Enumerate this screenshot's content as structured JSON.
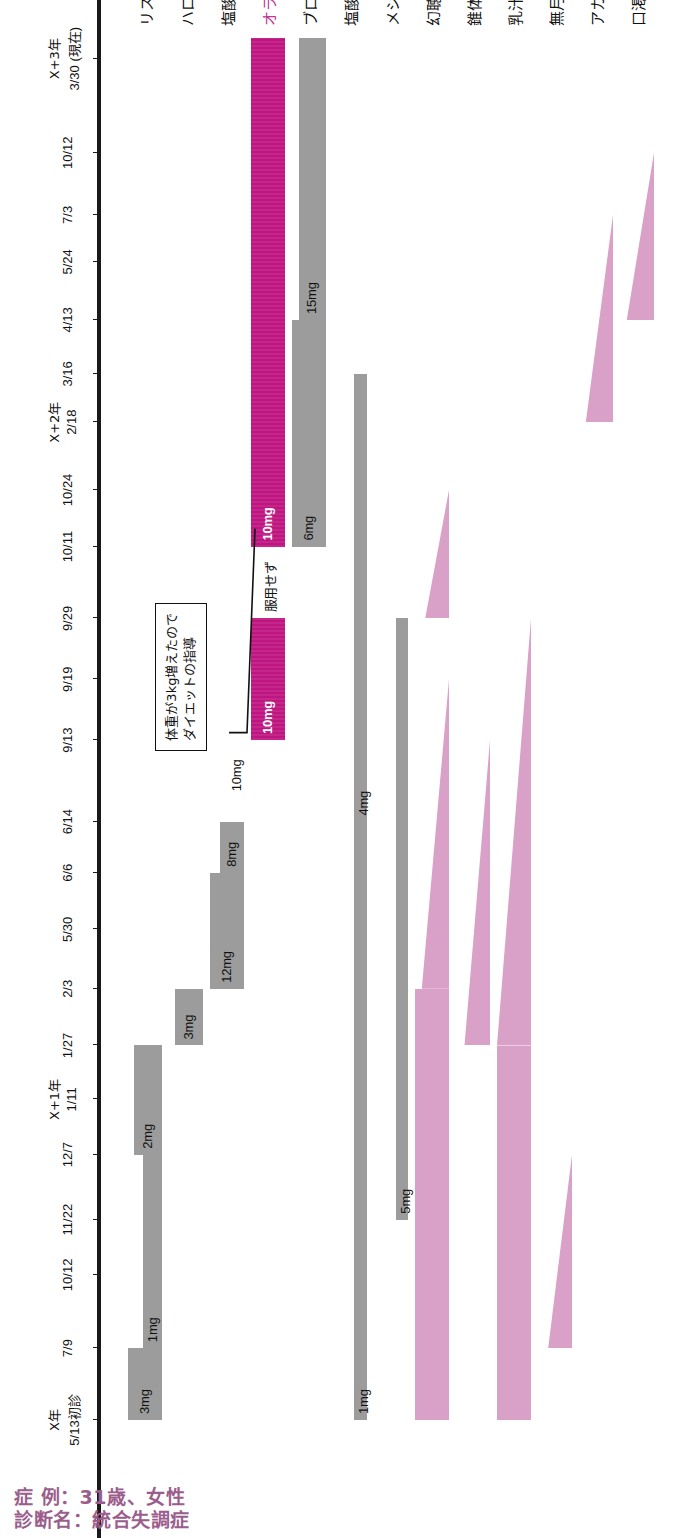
{
  "header": {
    "case_line": "症 例：31歳、女性",
    "diagnosis_line": "診断名：統合失調症",
    "accent_color": "#9B5E8C"
  },
  "chart_data": {
    "type": "table",
    "xlabel": "",
    "ylabel": "",
    "grid": false,
    "legend_position": "none",
    "axis": {
      "name": "治療経過（日付）",
      "ticks": [
        {
          "year": "X年",
          "date": "5/13初診",
          "pos": 0.0
        },
        {
          "year": "",
          "date": "7/9",
          "pos": 0.052
        },
        {
          "year": "",
          "date": "10/12",
          "pos": 0.105
        },
        {
          "year": "",
          "date": "11/22",
          "pos": 0.145
        },
        {
          "year": "",
          "date": "12/7",
          "pos": 0.192
        },
        {
          "year": "X+1年",
          "date": "1/11",
          "pos": 0.232
        },
        {
          "year": "",
          "date": "1/27",
          "pos": 0.271
        },
        {
          "year": "",
          "date": "2/3",
          "pos": 0.312
        },
        {
          "year": "",
          "date": "5/30",
          "pos": 0.355
        },
        {
          "year": "",
          "date": "6/6",
          "pos": 0.396
        },
        {
          "year": "",
          "date": "6/14",
          "pos": 0.433
        },
        {
          "year": "",
          "date": "9/13",
          "pos": 0.492
        },
        {
          "year": "",
          "date": "9/19",
          "pos": 0.536
        },
        {
          "year": "",
          "date": "9/29",
          "pos": 0.58
        },
        {
          "year": "",
          "date": "10/11",
          "pos": 0.632
        },
        {
          "year": "",
          "date": "10/24",
          "pos": 0.673
        },
        {
          "year": "X+2年",
          "date": "2/18",
          "pos": 0.722
        },
        {
          "year": "",
          "date": "3/16",
          "pos": 0.757
        },
        {
          "year": "",
          "date": "4/13",
          "pos": 0.796
        },
        {
          "year": "",
          "date": "5/24",
          "pos": 0.838
        },
        {
          "year": "",
          "date": "7/3",
          "pos": 0.872
        },
        {
          "year": "",
          "date": "10/12",
          "pos": 0.917
        },
        {
          "year": "X+3年",
          "date": "3/30 (現在)",
          "pos": 0.985
        }
      ]
    },
    "rows": [
      {
        "label": "リスペリドン",
        "kind": "drug",
        "accent": false,
        "segments": [
          {
            "dose": "3mg",
            "start": 0.0,
            "end": 0.052,
            "thick": 1.0
          },
          {
            "dose": "1mg",
            "start": 0.052,
            "end": 0.192,
            "thick": 0.55
          },
          {
            "dose": "2mg",
            "start": 0.192,
            "end": 0.271,
            "thick": 0.82
          }
        ]
      },
      {
        "label": "ハロペリドール",
        "kind": "drug",
        "accent": false,
        "segments": [
          {
            "dose": "3mg",
            "start": 0.271,
            "end": 0.312,
            "thick": 0.82
          }
        ]
      },
      {
        "label": "塩酸ペロスピロン",
        "kind": "drug",
        "accent": false,
        "segments": [
          {
            "dose": "12mg",
            "start": 0.312,
            "end": 0.396,
            "thick": 1.0
          },
          {
            "dose": "8mg",
            "start": 0.396,
            "end": 0.433,
            "thick": 0.72
          }
        ]
      },
      {
        "label": "オランザピン",
        "kind": "drug",
        "accent": true,
        "note": "10mg",
        "segments": [
          {
            "dose": "10mg",
            "start": 0.492,
            "end": 0.58,
            "thick": 1.0,
            "color": "magenta"
          },
          {
            "dose": "服用せず",
            "start": 0.58,
            "end": 0.632,
            "thick": 0.0,
            "color": "gap"
          },
          {
            "dose": "10mg",
            "start": 0.632,
            "end": 1.0,
            "thick": 1.0,
            "color": "magenta"
          }
        ]
      },
      {
        "label": "ブロマゼパム",
        "kind": "drug",
        "accent": false,
        "segments": [
          {
            "dose": "6mg",
            "start": 0.632,
            "end": 0.796,
            "thick": 1.0
          },
          {
            "dose": "15mg",
            "start": 0.796,
            "end": 1.0,
            "thick": 0.8
          }
        ]
      },
      {
        "label": "塩酸ビペリデン",
        "kind": "drug",
        "accent": false,
        "segments": [
          {
            "dose": "1mg",
            "start": 0.0,
            "end": 0.433,
            "thick": 0.38
          },
          {
            "dose": "4mg",
            "start": 0.433,
            "end": 0.757,
            "thick": 0.38
          }
        ]
      },
      {
        "label": "メシル酸ブロモクリプチン",
        "kind": "drug",
        "accent": false,
        "segments": [
          {
            "dose": "5mg",
            "start": 0.145,
            "end": 0.58,
            "thick": 0.34
          }
        ]
      },
      {
        "label": "幻聴",
        "kind": "symptom",
        "accent": false,
        "wedges": [
          {
            "start": 0.0,
            "end": 0.312,
            "from": 1.0,
            "to": 1.0
          },
          {
            "start": 0.312,
            "end": 0.536,
            "from": 0.8,
            "to": 0.0
          },
          {
            "start": 0.58,
            "end": 0.673,
            "from": 0.7,
            "to": 0.0
          }
        ]
      },
      {
        "label": "錐体外路症状",
        "kind": "symptom",
        "accent": false,
        "wedges": [
          {
            "start": 0.271,
            "end": 0.492,
            "from": 0.75,
            "to": 0.0
          }
        ]
      },
      {
        "label": "乳汁分泌",
        "kind": "symptom",
        "accent": false,
        "wedges": [
          {
            "start": 0.0,
            "end": 0.271,
            "from": 1.0,
            "to": 1.0
          },
          {
            "start": 0.271,
            "end": 0.58,
            "from": 1.0,
            "to": 0.0
          }
        ]
      },
      {
        "label": "無月経",
        "kind": "symptom",
        "accent": false,
        "wedges": [
          {
            "start": 0.052,
            "end": 0.192,
            "from": 0.7,
            "to": 0.0
          }
        ]
      },
      {
        "label": "アカシジア",
        "kind": "symptom",
        "accent": false,
        "wedges": [
          {
            "start": 0.722,
            "end": 0.872,
            "from": 0.8,
            "to": 0.0
          }
        ]
      },
      {
        "label": "口渇",
        "kind": "symptom",
        "accent": false,
        "wedges": [
          {
            "start": 0.796,
            "end": 0.917,
            "from": 0.8,
            "to": 0.0
          }
        ]
      }
    ],
    "annotations": [
      {
        "id": "diet-callout",
        "lines": [
          "体重が3kg増えたので",
          "ダイエットの指導"
        ],
        "target_row": "オランザピン",
        "target_pos": 0.645
      }
    ],
    "colors": {
      "drug_bar": "#9C9C9C",
      "olanzapine_bar": "#BE1580",
      "symptom_bar": "#D9A0C8",
      "title": "#9B5E8C",
      "accent_label": "#C2348E",
      "axis": "#1A1A1A"
    }
  }
}
